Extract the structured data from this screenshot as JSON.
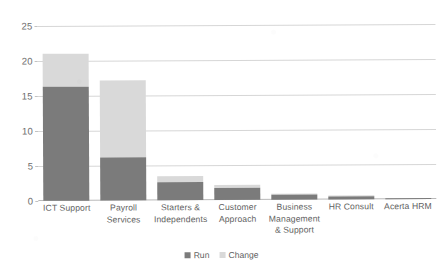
{
  "chart_data": {
    "type": "bar",
    "stacked": true,
    "title": "",
    "xlabel": "",
    "ylabel": "",
    "ylim": [
      0,
      25
    ],
    "yticks": [
      0,
      5,
      10,
      15,
      20,
      25
    ],
    "grid": true,
    "legend_position": "bottom",
    "categories": [
      "ICT Support",
      "Payroll Services",
      "Starters & Independents",
      "Customer Approach",
      "Business Management & Support",
      "HR Consult",
      "Acerta HRM"
    ],
    "series": [
      {
        "name": "Run",
        "color": "#7b7b7b",
        "values": [
          16.3,
          6.1,
          2.6,
          1.7,
          0.7,
          0.5,
          0.15
        ]
      },
      {
        "name": "Change",
        "color": "#d9d9d9",
        "values": [
          4.7,
          11.1,
          0.8,
          0.5,
          0.2,
          0.1,
          0.05
        ]
      }
    ],
    "totals": [
      21.0,
      17.2,
      3.4,
      2.2,
      0.9,
      0.6,
      0.2
    ]
  },
  "axis": {
    "y_tick_labels": [
      "0",
      "5",
      "10",
      "15",
      "20",
      "25"
    ]
  },
  "x_axis": {
    "labels": [
      "ICT Support",
      "Payroll\nServices",
      "Starters &\nIndependents",
      "Customer\nApproach",
      "Business\nManagement\n& Support",
      "HR Consult",
      "Acerta HRM"
    ]
  },
  "legend": {
    "items": [
      {
        "label": "Run",
        "color": "#7b7b7b"
      },
      {
        "label": "Change",
        "color": "#d9d9d9"
      }
    ]
  }
}
